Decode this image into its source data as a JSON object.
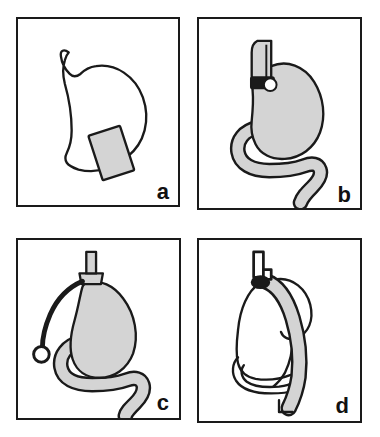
{
  "figure": {
    "background_color": "#ffffff",
    "outline_color": "#1a1a1a",
    "organ_fill_gray": "#d4d4d4",
    "organ_fill_white": "#ffffff",
    "panel_border_color": "#1a1a1a",
    "panels": [
      {
        "id": "a",
        "label": "a",
        "caption_letter": "a",
        "organ": "stomach",
        "organ_fill": "#ffffff",
        "elements": [
          {
            "name": "stomach-outline",
            "fill": "#ffffff",
            "stroke": "#1a1a1a"
          },
          {
            "name": "esophagus-notch",
            "fill": "#ffffff",
            "stroke": "#1a1a1a"
          },
          {
            "name": "gray-rectangle-implant",
            "fill": "#d4d4d4",
            "stroke": "#1a1a1a",
            "rotation_deg": -18
          }
        ]
      },
      {
        "id": "b",
        "label": "b",
        "caption_letter": "b",
        "organ": "stomach-with-duodenum",
        "organ_fill": "#d4d4d4",
        "elements": [
          {
            "name": "stomach-body-filled",
            "fill": "#d4d4d4",
            "stroke": "#1a1a1a"
          },
          {
            "name": "duodenum-tube",
            "fill": "#d4d4d4",
            "stroke": "#1a1a1a"
          },
          {
            "name": "esophageal-tube-device",
            "fill": "#d4d4d4",
            "stroke": "#1a1a1a"
          },
          {
            "name": "device-black-band",
            "fill": "#1a1a1a",
            "stroke": "#1a1a1a"
          },
          {
            "name": "device-white-port",
            "fill": "#ffffff",
            "stroke": "#1a1a1a"
          }
        ]
      },
      {
        "id": "c",
        "label": "c",
        "caption_letter": "c",
        "organ": "stomach-with-duodenum",
        "organ_fill": "#d4d4d4",
        "elements": [
          {
            "name": "stomach-body-filled",
            "fill": "#d4d4d4",
            "stroke": "#1a1a1a"
          },
          {
            "name": "duodenum-tube",
            "fill": "#d4d4d4",
            "stroke": "#1a1a1a"
          },
          {
            "name": "esophagus-stub",
            "fill": "#d4d4d4",
            "stroke": "#1a1a1a"
          },
          {
            "name": "gastric-band-collar",
            "fill": "#d4d4d4",
            "stroke": "#1a1a1a"
          },
          {
            "name": "band-connector-tubing",
            "fill": "none",
            "stroke": "#1a1a1a"
          },
          {
            "name": "subcutaneous-access-port",
            "fill": "#ffffff",
            "stroke": "#1a1a1a"
          }
        ]
      },
      {
        "id": "d",
        "label": "d",
        "caption_letter": "d",
        "organ": "stomach-sleeve",
        "organ_fill": "#ffffff",
        "elements": [
          {
            "name": "resected-stomach-outline",
            "fill": "#ffffff",
            "stroke": "#1a1a1a"
          },
          {
            "name": "gastric-sleeve-tube",
            "fill": "#d4d4d4",
            "stroke": "#1a1a1a"
          },
          {
            "name": "esophagus-stub",
            "fill": "#ffffff",
            "stroke": "#1a1a1a"
          },
          {
            "name": "staple-clamp",
            "fill": "#1a1a1a",
            "stroke": "#1a1a1a"
          },
          {
            "name": "duodenum-outline",
            "fill": "#ffffff",
            "stroke": "#1a1a1a"
          }
        ]
      }
    ]
  }
}
